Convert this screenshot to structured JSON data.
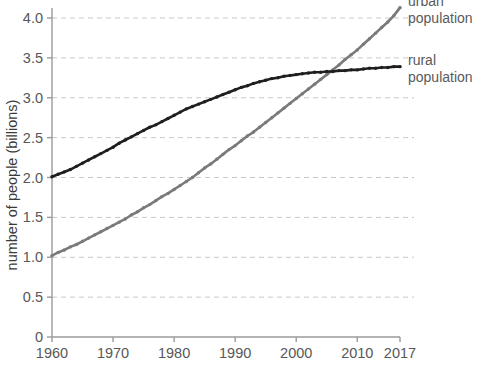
{
  "chart_data": {
    "type": "line",
    "title": "",
    "xlabel": "",
    "ylabel": "number of people (billions)",
    "xlim": [
      1960,
      2017
    ],
    "ylim": [
      0,
      4.25
    ],
    "grid": true,
    "grid_axis": "y",
    "legend_position": "right-inline-labels",
    "x_ticks": [
      "1960",
      "1970",
      "1980",
      "1990",
      "2000",
      "2010",
      "2017"
    ],
    "x_tick_values": [
      1960,
      1970,
      1980,
      1990,
      2000,
      2010,
      2017
    ],
    "y_ticks": [
      "0",
      "0.5",
      "1.0",
      "1.5",
      "2.0",
      "2.5",
      "3.0",
      "3.5",
      "4.0"
    ],
    "y_tick_values": [
      0,
      0.5,
      1.0,
      1.5,
      2.0,
      2.5,
      3.0,
      3.5,
      4.0
    ],
    "x": [
      1960,
      1961,
      1962,
      1963,
      1964,
      1965,
      1966,
      1967,
      1968,
      1969,
      1970,
      1971,
      1972,
      1973,
      1974,
      1975,
      1976,
      1977,
      1978,
      1979,
      1980,
      1981,
      1982,
      1983,
      1984,
      1985,
      1986,
      1987,
      1988,
      1989,
      1990,
      1991,
      1992,
      1993,
      1994,
      1995,
      1996,
      1997,
      1998,
      1999,
      2000,
      2001,
      2002,
      2003,
      2004,
      2005,
      2006,
      2007,
      2008,
      2009,
      2010,
      2011,
      2012,
      2013,
      2014,
      2015,
      2016,
      2017
    ],
    "series": [
      {
        "name": "urban population",
        "color": "#7a7a7a",
        "marker": "dot",
        "values": [
          1.02,
          1.06,
          1.09,
          1.13,
          1.16,
          1.2,
          1.24,
          1.28,
          1.32,
          1.36,
          1.4,
          1.44,
          1.48,
          1.53,
          1.57,
          1.62,
          1.66,
          1.71,
          1.76,
          1.8,
          1.85,
          1.9,
          1.95,
          2.0,
          2.06,
          2.12,
          2.17,
          2.23,
          2.29,
          2.35,
          2.4,
          2.46,
          2.52,
          2.57,
          2.63,
          2.69,
          2.75,
          2.81,
          2.87,
          2.93,
          2.99,
          3.05,
          3.11,
          3.17,
          3.23,
          3.29,
          3.35,
          3.41,
          3.48,
          3.54,
          3.6,
          3.67,
          3.74,
          3.81,
          3.88,
          3.95,
          4.03,
          4.13
        ]
      },
      {
        "name": "rural population",
        "color": "#1f1f1f",
        "marker": "dot",
        "values": [
          2.01,
          2.04,
          2.07,
          2.1,
          2.14,
          2.18,
          2.22,
          2.26,
          2.3,
          2.34,
          2.38,
          2.43,
          2.47,
          2.51,
          2.55,
          2.59,
          2.63,
          2.66,
          2.7,
          2.74,
          2.78,
          2.82,
          2.86,
          2.89,
          2.92,
          2.95,
          2.98,
          3.01,
          3.04,
          3.07,
          3.1,
          3.13,
          3.15,
          3.18,
          3.2,
          3.22,
          3.24,
          3.25,
          3.27,
          3.28,
          3.29,
          3.3,
          3.31,
          3.32,
          3.32,
          3.33,
          3.33,
          3.34,
          3.34,
          3.35,
          3.35,
          3.36,
          3.37,
          3.37,
          3.38,
          3.38,
          3.39,
          3.39
        ]
      }
    ],
    "annotations": [
      {
        "text_line1": "urban",
        "text_line2": "population",
        "series": "urban population"
      },
      {
        "text_line1": "rural",
        "text_line2": "population",
        "series": "rural population"
      }
    ],
    "colors": {
      "urban": "#7a7a7a",
      "rural": "#1f1f1f",
      "gridline": "#c8c8c8",
      "axis": "#9a9a9a",
      "tick_text": "#575757",
      "label_text": "#5a5a5a",
      "background": "#ffffff"
    }
  }
}
